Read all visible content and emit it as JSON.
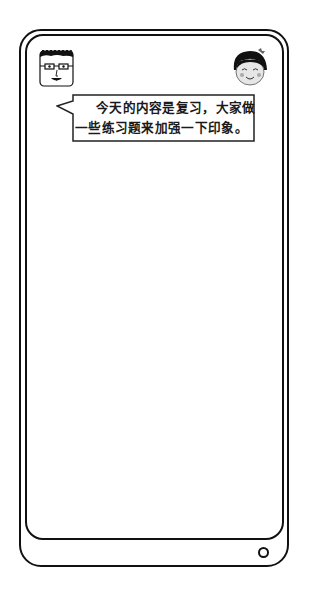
{
  "device": {
    "type": "phone-frame",
    "frame_color": "#111111",
    "screen_color": "#ffffff",
    "home_button_icon": "circle-home-icon"
  },
  "characters": {
    "left": {
      "icon": "boy-with-glasses-avatar-icon"
    },
    "right": {
      "icon": "smiling-girl-avatar-icon"
    }
  },
  "speech_bubble": {
    "speaker": "left",
    "lines": [
      "今天的内容是复习，大家做",
      "一些练习题来加强一下印象。"
    ]
  }
}
